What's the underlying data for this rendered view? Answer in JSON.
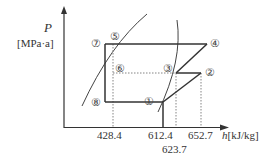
{
  "diagram": {
    "type": "p-h diagram (refrigeration cycle)",
    "y_axis": {
      "symbol": "P",
      "unit": "[MPa·a]"
    },
    "x_axis": {
      "symbol": "h",
      "unit": "[kJ/kg]"
    },
    "h_ticks": [
      {
        "value": "428.4",
        "x": 113
      },
      {
        "value": "612.4",
        "x": 163
      },
      {
        "value": "623.7",
        "x": 176
      },
      {
        "value": "652.7",
        "x": 201
      }
    ],
    "states": [
      {
        "id": "1",
        "label": "①"
      },
      {
        "id": "2",
        "label": "②"
      },
      {
        "id": "3",
        "label": "③"
      },
      {
        "id": "4",
        "label": "④"
      },
      {
        "id": "5",
        "label": "⑤"
      },
      {
        "id": "6",
        "label": "⑥"
      },
      {
        "id": "7",
        "label": "⑦"
      },
      {
        "id": "8",
        "label": "⑧"
      }
    ],
    "colors": {
      "line": "#333333",
      "dotted": "#777777",
      "curve": "#444444"
    }
  }
}
